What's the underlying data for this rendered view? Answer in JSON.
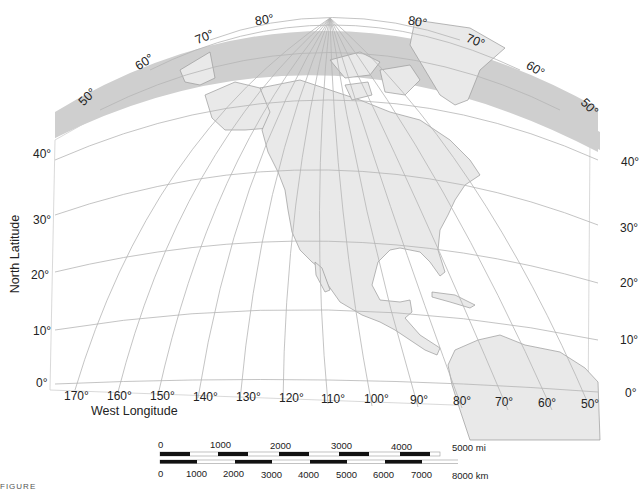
{
  "map": {
    "title_stub": "FIGURE",
    "colors": {
      "band": "#cfcfcf",
      "land": "#e9e9e9",
      "graticule": "#b5b5b5",
      "coast": "#9a9a9a",
      "text": "#222222"
    },
    "arc_latitude_labels_left": [
      "50°",
      "60°",
      "70°",
      "80°"
    ],
    "arc_latitude_labels_right": [
      "80°",
      "70°",
      "60°",
      "50°"
    ],
    "left_latitude_labels": [
      "40°",
      "30°",
      "20°",
      "10°",
      "0°"
    ],
    "right_latitude_labels": [
      "40°",
      "30°",
      "20°",
      "10°",
      "0°"
    ],
    "longitude_labels": [
      "170°",
      "160°",
      "150°",
      "140°",
      "130°",
      "120°",
      "110°",
      "100°",
      "90°",
      "80°",
      "70°",
      "60°",
      "50°"
    ],
    "y_axis_title": "North Latitude",
    "x_axis_title": "West Longitude"
  },
  "scale_bar": {
    "miles": {
      "ticks": [
        "0",
        "1000",
        "2000",
        "3000",
        "4000",
        "5000 mi"
      ]
    },
    "km": {
      "ticks": [
        "0",
        "1000",
        "2000",
        "3000",
        "4000",
        "5000",
        "6000",
        "7000",
        "8000 km"
      ]
    }
  }
}
